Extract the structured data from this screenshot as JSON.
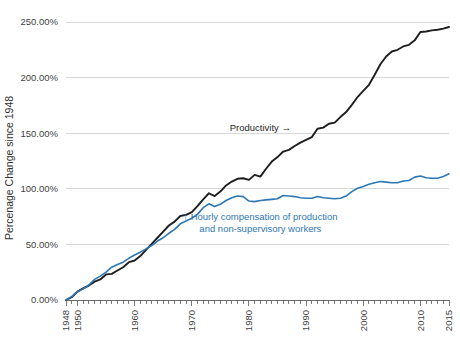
{
  "chart_data": {
    "type": "line",
    "title": "",
    "xlabel": "",
    "ylabel": "Percenage Change since 1948",
    "xlim": [
      1948,
      2015
    ],
    "ylim": [
      0,
      250
    ],
    "grid": true,
    "legend_position": "inline-annotations",
    "y_ticks": [
      0,
      50,
      100,
      150,
      200,
      250
    ],
    "y_tick_labels": [
      "0.00%",
      "50.00%",
      "100.00%",
      "150.00%",
      "200.00%",
      "250.00%"
    ],
    "x_ticks": [
      1948,
      1950,
      1960,
      1970,
      1980,
      1990,
      2000,
      2010,
      2015
    ],
    "x_tick_labels": [
      "1948",
      "1950",
      "1960",
      "1970",
      "1980",
      "1990",
      "2000",
      "2010",
      "2015"
    ],
    "x_minor_tick_step": 1,
    "annotations": [
      {
        "name": "productivity-annotation",
        "text": "Productivity →",
        "color": "#262626",
        "x": 1982,
        "y": 152
      },
      {
        "name": "compensation-annotation",
        "text": "↑ Hourly compensation of production",
        "text_line2": "and non-supervisory workers",
        "color": "#2e77b5",
        "x": 1982,
        "y": 72
      }
    ],
    "series": [
      {
        "name": "Productivity",
        "color": "#1e1e1e",
        "stroke_width": 1.9,
        "x": [
          1948,
          1949,
          1950,
          1951,
          1952,
          1953,
          1954,
          1955,
          1956,
          1957,
          1958,
          1959,
          1960,
          1961,
          1962,
          1963,
          1964,
          1965,
          1966,
          1967,
          1968,
          1969,
          1970,
          1971,
          1972,
          1973,
          1974,
          1975,
          1976,
          1977,
          1978,
          1979,
          1980,
          1981,
          1982,
          1983,
          1984,
          1985,
          1986,
          1987,
          1988,
          1989,
          1990,
          1991,
          1992,
          1993,
          1994,
          1995,
          1996,
          1997,
          1998,
          1999,
          2000,
          2001,
          2002,
          2003,
          2004,
          2005,
          2006,
          2007,
          2008,
          2009,
          2010,
          2011,
          2012,
          2013,
          2014,
          2015
        ],
        "values": [
          0,
          2.5,
          7.5,
          10.5,
          13.0,
          16.5,
          18.5,
          23.0,
          23.5,
          26.5,
          29.5,
          34.0,
          35.5,
          39.5,
          45.0,
          50.5,
          56.0,
          61.5,
          67.0,
          70.5,
          75.5,
          76.5,
          79.0,
          84.5,
          90.5,
          96.0,
          93.5,
          97.5,
          103.0,
          106.5,
          109.0,
          109.5,
          108.0,
          112.5,
          111.0,
          118.0,
          124.5,
          128.5,
          133.5,
          135.0,
          138.5,
          141.5,
          144.0,
          146.5,
          154.0,
          155.0,
          158.5,
          159.5,
          164.5,
          169.0,
          175.5,
          182.5,
          188.0,
          193.5,
          202.5,
          212.0,
          219.0,
          223.5,
          225.0,
          228.0,
          229.5,
          233.5,
          241.0,
          241.5,
          242.5,
          243.0,
          244.0,
          245.5
        ]
      },
      {
        "name": "Hourly compensation of production and non-supervisory workers",
        "color": "#2e77b5",
        "stroke_width": 1.6,
        "x": [
          1948,
          1949,
          1950,
          1951,
          1952,
          1953,
          1954,
          1955,
          1956,
          1957,
          1958,
          1959,
          1960,
          1961,
          1962,
          1963,
          1964,
          1965,
          1966,
          1967,
          1968,
          1969,
          1970,
          1971,
          1972,
          1973,
          1974,
          1975,
          1976,
          1977,
          1978,
          1979,
          1980,
          1981,
          1982,
          1983,
          1984,
          1985,
          1986,
          1987,
          1988,
          1989,
          1990,
          1991,
          1992,
          1993,
          1994,
          1995,
          1996,
          1997,
          1998,
          1999,
          2000,
          2001,
          2002,
          2003,
          2004,
          2005,
          2006,
          2007,
          2008,
          2009,
          2010,
          2011,
          2012,
          2013,
          2014,
          2015
        ],
        "values": [
          0,
          3.0,
          7.5,
          10.0,
          13.5,
          18.5,
          21.5,
          25.0,
          29.5,
          32.0,
          34.0,
          37.5,
          40.5,
          43.0,
          46.0,
          49.0,
          53.0,
          56.0,
          60.0,
          63.5,
          68.5,
          71.0,
          73.5,
          77.0,
          83.0,
          86.5,
          84.0,
          86.0,
          89.5,
          92.0,
          93.5,
          93.0,
          89.0,
          88.5,
          89.5,
          90.0,
          90.5,
          91.0,
          94.0,
          93.5,
          93.0,
          92.0,
          91.5,
          91.5,
          93.0,
          92.0,
          91.5,
          91.0,
          91.5,
          93.5,
          97.5,
          100.5,
          102.0,
          104.0,
          105.5,
          106.5,
          106.0,
          105.5,
          105.5,
          107.0,
          107.5,
          110.5,
          111.5,
          110.0,
          109.5,
          109.5,
          111.0,
          113.5
        ]
      }
    ]
  }
}
